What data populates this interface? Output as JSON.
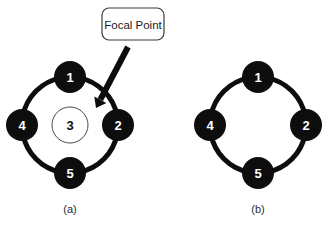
{
  "figure": {
    "background_color": "#ffffff",
    "ink_color": "#0d0d0d",
    "node_fill_color": "#0d0d0d",
    "node_label_color": "#ffffff",
    "center_node_fill_color": "#ffffff",
    "center_node_stroke_color": "#4a4a4a",
    "center_node_label_color": "#111111"
  },
  "callout": {
    "label": "Focal Point",
    "box": {
      "x": 102,
      "y": 8,
      "width": 62,
      "height": 32,
      "radius": 7
    },
    "border_color": "#3a3a3a",
    "fill_color": "#ffffff"
  },
  "arrow": {
    "name": "focal-point-arrow",
    "start_x": 128,
    "start_y": 47,
    "end_x": 96,
    "end_y": 108,
    "stroke_width": 6,
    "head_size": 11,
    "color": "#0d0d0d"
  },
  "panels": [
    {
      "id": "panel-a",
      "caption": "(a)",
      "caption_x": 70,
      "caption_y": 209,
      "ring": {
        "center_x": 70,
        "center_y": 125,
        "radius": 48,
        "stroke_width": 5,
        "gap_degrees": 22
      },
      "has_center_node": true,
      "center_node": {
        "label": "3",
        "radius": 18
      },
      "nodes": [
        {
          "label": "1",
          "angle_degrees": -90,
          "radius": 16,
          "cx": 70,
          "cy": 77
        },
        {
          "label": "2",
          "angle_degrees": 0,
          "radius": 16,
          "cx": 118,
          "cy": 125
        },
        {
          "label": "5",
          "angle_degrees": 90,
          "radius": 16,
          "cx": 70,
          "cy": 173
        },
        {
          "label": "4",
          "angle_degrees": 180,
          "radius": 16,
          "cx": 22,
          "cy": 125
        }
      ]
    },
    {
      "id": "panel-b",
      "caption": "(b)",
      "caption_x": 258,
      "caption_y": 209,
      "ring": {
        "center_x": 258,
        "center_y": 125,
        "radius": 48,
        "stroke_width": 5,
        "gap_degrees": 22
      },
      "has_center_node": false,
      "center_node": null,
      "nodes": [
        {
          "label": "1",
          "angle_degrees": -90,
          "radius": 16,
          "cx": 258,
          "cy": 77
        },
        {
          "label": "2",
          "angle_degrees": 0,
          "radius": 16,
          "cx": 306,
          "cy": 125
        },
        {
          "label": "5",
          "angle_degrees": 90,
          "radius": 16,
          "cx": 258,
          "cy": 173
        },
        {
          "label": "4",
          "angle_degrees": 180,
          "radius": 16,
          "cx": 210,
          "cy": 125
        }
      ]
    }
  ],
  "chart_data": {
    "type": "diagram",
    "title": "",
    "panels": [
      {
        "caption": "(a)",
        "ring_nodes": [
          "1",
          "2",
          "5",
          "4"
        ],
        "center_node": "3",
        "annotation": "Focal Point",
        "annotation_target": "3"
      },
      {
        "caption": "(b)",
        "ring_nodes": [
          "1",
          "2",
          "5",
          "4"
        ],
        "center_node": null,
        "annotation": null,
        "annotation_target": null
      }
    ]
  }
}
